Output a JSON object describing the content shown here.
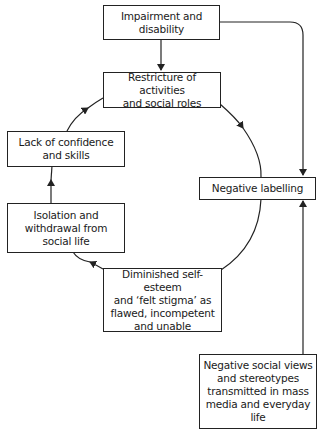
{
  "diagram": {
    "type": "cycle-flowchart",
    "nodes": {
      "impairment": {
        "label": "Impairment and\ndisability"
      },
      "restricture": {
        "label": "Restricture of activities\nand social roles"
      },
      "lack_confidence": {
        "label": "Lack of confidence\nand skills"
      },
      "isolation": {
        "label": "Isolation and\nwithdrawal from\nsocial life"
      },
      "diminished": {
        "label": "Diminished self-esteem\nand ‘felt stigma’ as\nflawed, incompetent\nand unable"
      },
      "negative_labelling": {
        "label": "Negative labelling"
      },
      "negative_social_views": {
        "label": "Negative social views\nand stereotypes\ntransmitted in mass\nmedia and everyday\nlife"
      }
    },
    "edges": [
      {
        "from": "impairment",
        "to": "restricture"
      },
      {
        "from": "impairment",
        "to": "negative_labelling"
      },
      {
        "from": "restricture",
        "to": "negative_labelling",
        "style": "cycle-arc"
      },
      {
        "from": "negative_labelling",
        "to": "diminished",
        "style": "cycle-arc"
      },
      {
        "from": "diminished",
        "to": "isolation",
        "style": "cycle-arc"
      },
      {
        "from": "isolation",
        "to": "lack_confidence",
        "style": "cycle-arc"
      },
      {
        "from": "lack_confidence",
        "to": "restricture",
        "style": "cycle-arc"
      },
      {
        "from": "negative_social_views",
        "to": "negative_labelling"
      }
    ]
  }
}
